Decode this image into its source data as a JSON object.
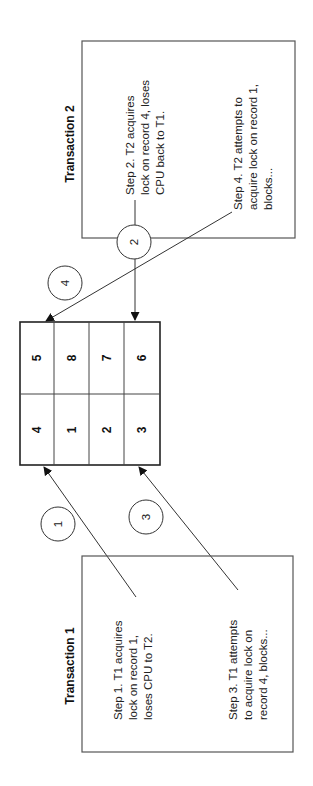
{
  "diagram": {
    "orientation": "rotated-90-ccw",
    "transaction2": {
      "title": "Transaction 2",
      "step2": {
        "lines": [
          "Step 2. T2 acquires",
          "lock on record 4, loses",
          "CPU back to T1."
        ]
      },
      "step4": {
        "lines": [
          "Step 4. T2 attempts to",
          "acquire lock on record 1,",
          "blocks..."
        ]
      }
    },
    "transaction1": {
      "title": "Transaction 1",
      "step1": {
        "lines": [
          "Step 1. T1 acquires",
          "lock on record 1,",
          "loses CPU to T2."
        ]
      },
      "step3": {
        "lines": [
          "Step 3. T1 attempts",
          "to acquire lock on",
          "record 4, blocks..."
        ]
      }
    },
    "records_grid": {
      "rows": [
        [
          "4",
          "1",
          "2",
          "3"
        ],
        [
          "5",
          "8",
          "7",
          "6"
        ]
      ]
    },
    "step_markers": [
      "1",
      "2",
      "3",
      "4"
    ]
  }
}
